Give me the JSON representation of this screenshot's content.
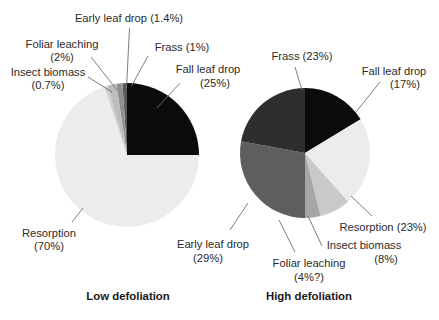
{
  "figure": {
    "title": "",
    "background": "#ffffff",
    "text_color": "#2b2b2b"
  },
  "chart_data": [
    {
      "type": "pie",
      "title": "Low defoliation",
      "labels": [
        "Fall leaf drop",
        "Resorption",
        "Insect biomass",
        "Foliar leaching",
        "Early leaf drop",
        "Frass"
      ],
      "values": [
        25,
        70,
        0.7,
        2,
        1.4,
        1
      ],
      "value_suffixes": [
        "%",
        "%",
        "%",
        "%",
        "%",
        "%"
      ],
      "colors": [
        "#0b0b0b",
        "#ececec",
        "#d0d0d0",
        "#bdbdbd",
        "#8f8f8f",
        "#5a5a5a"
      ],
      "legend": "none",
      "start_angle_deg": 0,
      "direction": "clockwise"
    },
    {
      "type": "pie",
      "title": "High defoliation",
      "labels": [
        "Fall leaf drop",
        "Resorption",
        "Insect biomass",
        "Foliar leaching",
        "Early leaf drop",
        "Frass"
      ],
      "values": [
        17,
        23,
        8,
        4,
        29,
        23
      ],
      "value_suffixes": [
        "%",
        "%",
        "%",
        "%?",
        "%",
        "%"
      ],
      "colors": [
        "#0b0b0b",
        "#ececec",
        "#c9c9c9",
        "#a6a6a6",
        "#5e5e5e",
        "#2e2e2e"
      ],
      "legend": "none",
      "start_angle_deg": 0,
      "direction": "clockwise"
    }
  ],
  "left_chart": {
    "caption": "Low defoliation",
    "labels": {
      "early_leaf_drop": {
        "line1": "Early leaf drop (1.4%)",
        "line2": ""
      },
      "foliar_leaching": {
        "line1": "Foliar leaching",
        "line2": "(2%)"
      },
      "insect_biomass": {
        "line1": "Insect biomass",
        "line2": "(0.7%)"
      },
      "frass": {
        "line1": "Frass (1%)",
        "line2": ""
      },
      "fall_leaf_drop": {
        "line1": "Fall leaf drop",
        "line2": "(25%)"
      },
      "resorption": {
        "line1": "Resorption",
        "line2": "(70%)"
      }
    }
  },
  "right_chart": {
    "caption": "High defoliation",
    "labels": {
      "frass": {
        "line1": "Frass (23%)",
        "line2": ""
      },
      "fall_leaf_drop": {
        "line1": "Fall leaf drop",
        "line2": "(17%)"
      },
      "resorption": {
        "line1": "Resorption (23%)",
        "line2": ""
      },
      "insect_biomass": {
        "line1": "Insect biomass",
        "line2": "(8%)"
      },
      "foliar_leaching": {
        "line1": "Foliar leaching",
        "line2": "(4%?)"
      },
      "early_leaf_drop": {
        "line1": "Early leaf drop",
        "line2": "(29%)"
      }
    }
  }
}
